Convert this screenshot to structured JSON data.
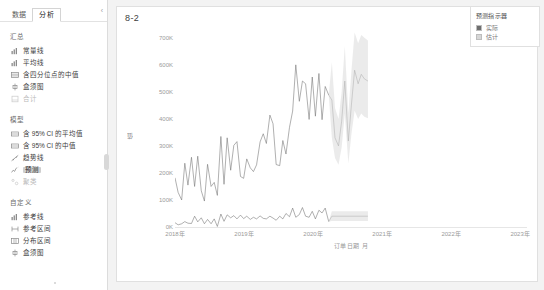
{
  "sidebar": {
    "tabs": [
      {
        "label": "数据",
        "active": false
      },
      {
        "label": "分析",
        "active": true
      }
    ],
    "collapse_icon": "chevron-left-icon",
    "groups": [
      {
        "title": "汇总",
        "items": [
          {
            "label": "常量线",
            "icon": "bar-chart-icon",
            "state": "normal"
          },
          {
            "label": "平均线",
            "icon": "bar-chart-icon",
            "state": "normal"
          },
          {
            "label": "含四分位点的中值",
            "icon": "table-icon",
            "state": "normal"
          },
          {
            "label": "盒须图",
            "icon": "boxplot-icon",
            "state": "normal"
          },
          {
            "label": "合计",
            "icon": "totals-icon",
            "state": "disabled"
          }
        ]
      },
      {
        "title": "模型",
        "items": [
          {
            "label": "含 95% CI 的平均值",
            "icon": "band-icon",
            "state": "normal"
          },
          {
            "label": "含 95% CI 的中值",
            "icon": "band-icon",
            "state": "normal"
          },
          {
            "label": "趋势线",
            "icon": "trendline-icon",
            "state": "normal"
          },
          {
            "label": "预测",
            "icon": "forecast-icon",
            "state": "selected"
          },
          {
            "label": "聚类",
            "icon": "cluster-icon",
            "state": "disabled"
          }
        ]
      },
      {
        "title": "自定义",
        "items": [
          {
            "label": "参考线",
            "icon": "reference-line-icon",
            "state": "normal"
          },
          {
            "label": "参考区间",
            "icon": "reference-band-icon",
            "state": "normal"
          },
          {
            "label": "分布区间",
            "icon": "distribution-band-icon",
            "state": "normal"
          },
          {
            "label": "盒须图",
            "icon": "boxplot-icon",
            "state": "normal"
          }
        ]
      }
    ]
  },
  "chart_card": {
    "title": "8-2"
  },
  "legend": {
    "title": "预测指示器",
    "entries": [
      {
        "label": "实际",
        "color": "#6e6e6e"
      },
      {
        "label": "估计",
        "color": "#d6d6d6"
      }
    ]
  },
  "colors": {
    "actual_line": "#6e6e6e",
    "forecast_line": "#b0b0b0",
    "forecast_band": "#e8e8e8",
    "panel": "#ffffff",
    "app_bg": "#f3f3f3"
  },
  "chart_data": {
    "type": "line",
    "title": "8-2",
    "xlabel": "订单日期 月",
    "ylabel": "值",
    "ylim": [
      0,
      740000
    ],
    "yticks": [
      0,
      100000,
      200000,
      300000,
      400000,
      500000,
      600000,
      700000
    ],
    "ytick_labels": [
      "0K",
      "100K",
      "200K",
      "300K",
      "400K",
      "500K",
      "600K",
      "700K"
    ],
    "xticks": [
      2018,
      2019,
      2020,
      2021,
      2022,
      2023
    ],
    "xtick_labels": [
      "2018年",
      "2019年",
      "2020年",
      "2021年",
      "2022年",
      "2023年"
    ],
    "grid": false,
    "legend_position": "top-right",
    "forecast_start_x": 2021.92,
    "x_range": [
      2018.0,
      2023.1
    ],
    "series": [
      {
        "name": "销售额 实际",
        "kind": "actual",
        "color": "#6e6e6e",
        "x": [
          2018.0,
          2018.08,
          2018.17,
          2018.25,
          2018.33,
          2018.42,
          2018.5,
          2018.58,
          2018.67,
          2018.75,
          2018.83,
          2018.92,
          2019.0,
          2019.08,
          2019.17,
          2019.25,
          2019.33,
          2019.42,
          2019.5,
          2019.58,
          2019.67,
          2019.75,
          2019.83,
          2019.92,
          2020.0,
          2020.08,
          2020.17,
          2020.25,
          2020.33,
          2020.42,
          2020.5,
          2020.58,
          2020.67,
          2020.75,
          2020.83,
          2020.92,
          2021.0,
          2021.08,
          2021.17,
          2021.25,
          2021.33,
          2021.42,
          2021.5,
          2021.58,
          2021.67,
          2021.75,
          2021.83,
          2021.92
        ],
        "y": [
          182000,
          128000,
          100000,
          236000,
          155000,
          258000,
          150000,
          262000,
          134000,
          96000,
          232000,
          150000,
          165000,
          117000,
          335000,
          158000,
          330000,
          210000,
          302000,
          316000,
          187000,
          180000,
          252000,
          219000,
          205000,
          230000,
          315000,
          345000,
          309000,
          414000,
          382000,
          231000,
          227000,
          320000,
          270000,
          369000,
          429000,
          600000,
          465000,
          540000,
          530000,
          398000,
          555000,
          410000,
          568000,
          397000,
          520000,
          488000
        ]
      },
      {
        "name": "销售额 估计",
        "kind": "forecast",
        "color": "#b0b0b0",
        "x": [
          2021.92,
          2022.0,
          2022.08,
          2022.17,
          2022.25,
          2022.33,
          2022.42,
          2022.5,
          2022.58,
          2022.67,
          2022.75,
          2022.83,
          2022.92
        ],
        "y": [
          488000,
          470000,
          330000,
          300000,
          392000,
          540000,
          318000,
          455000,
          580000,
          530000,
          565000,
          548000,
          540000
        ],
        "band_lower": [
          488000,
          330000,
          255000,
          230000,
          295000,
          420000,
          235000,
          345000,
          430000,
          400000,
          420000,
          408000,
          402000
        ],
        "band_upper": [
          488000,
          610000,
          440000,
          400000,
          500000,
          670000,
          420000,
          580000,
          720000,
          680000,
          710000,
          700000,
          690000
        ]
      },
      {
        "name": "利润 实际",
        "kind": "actual",
        "color": "#6e6e6e",
        "x": [
          2018.0,
          2018.08,
          2018.17,
          2018.25,
          2018.33,
          2018.42,
          2018.5,
          2018.58,
          2018.67,
          2018.75,
          2018.83,
          2018.92,
          2019.0,
          2019.08,
          2019.17,
          2019.25,
          2019.33,
          2019.42,
          2019.5,
          2019.58,
          2019.67,
          2019.75,
          2019.83,
          2019.92,
          2020.0,
          2020.08,
          2020.17,
          2020.25,
          2020.33,
          2020.42,
          2020.5,
          2020.58,
          2020.67,
          2020.75,
          2020.83,
          2020.92,
          2021.0,
          2021.08,
          2021.17,
          2021.25,
          2021.33,
          2021.42,
          2021.5,
          2021.58,
          2021.67,
          2021.75,
          2021.83,
          2021.92
        ],
        "y": [
          16000,
          8000,
          12000,
          20000,
          14000,
          13000,
          40000,
          19000,
          34000,
          12000,
          28000,
          12000,
          30000,
          2000,
          48000,
          21000,
          45000,
          34000,
          42000,
          30000,
          44000,
          31000,
          40000,
          28000,
          36000,
          30000,
          41000,
          32000,
          30000,
          40000,
          33000,
          25000,
          40000,
          30000,
          50000,
          38000,
          70000,
          36000,
          46000,
          72000,
          40000,
          36000,
          58000,
          30000,
          62000,
          52000,
          70000,
          20000
        ]
      },
      {
        "name": "利润 估计",
        "kind": "forecast",
        "color": "#b0b0b0",
        "x": [
          2021.92,
          2022.0,
          2022.92
        ],
        "y": [
          20000,
          40000,
          40000
        ],
        "band_lower": [
          20000,
          22000,
          22000
        ],
        "band_upper": [
          20000,
          58000,
          58000
        ]
      }
    ]
  }
}
